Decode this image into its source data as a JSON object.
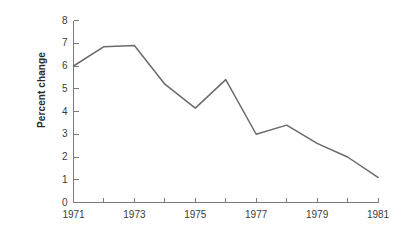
{
  "chart_data": {
    "type": "line",
    "title": "",
    "xlabel": "",
    "ylabel": "Percent change",
    "x": [
      1971,
      1972,
      1973,
      1974,
      1975,
      1976,
      1977,
      1978,
      1979,
      1980,
      1981
    ],
    "values": [
      6.0,
      6.85,
      6.9,
      5.2,
      4.15,
      5.4,
      3.0,
      3.4,
      2.6,
      2.0,
      1.1
    ],
    "series": [
      {
        "name": "Percent change",
        "values": [
          6.0,
          6.85,
          6.9,
          5.2,
          4.15,
          5.4,
          3.0,
          3.4,
          2.6,
          2.0,
          1.1
        ]
      }
    ],
    "xlim": [
      1971,
      1981
    ],
    "ylim": [
      0,
      8
    ],
    "x_tick_values": [
      1971,
      1972,
      1973,
      1974,
      1975,
      1976,
      1977,
      1978,
      1979,
      1980,
      1981
    ],
    "x_tick_labels": [
      "1971",
      "",
      "1973",
      "",
      "1975",
      "",
      "1977",
      "",
      "1979",
      "",
      "1981"
    ],
    "y_ticks": [
      0,
      1,
      2,
      3,
      4,
      5,
      6,
      7,
      8
    ],
    "y_tick_labels": [
      "0",
      "1",
      "2",
      "3",
      "4",
      "5",
      "6",
      "7",
      "8"
    ],
    "grid": false,
    "legend": null,
    "line_color": "#6a6a6a",
    "axis_color": "#7a7a7a",
    "text_color": "#3a3a3a",
    "background_color": "#ffffff"
  }
}
